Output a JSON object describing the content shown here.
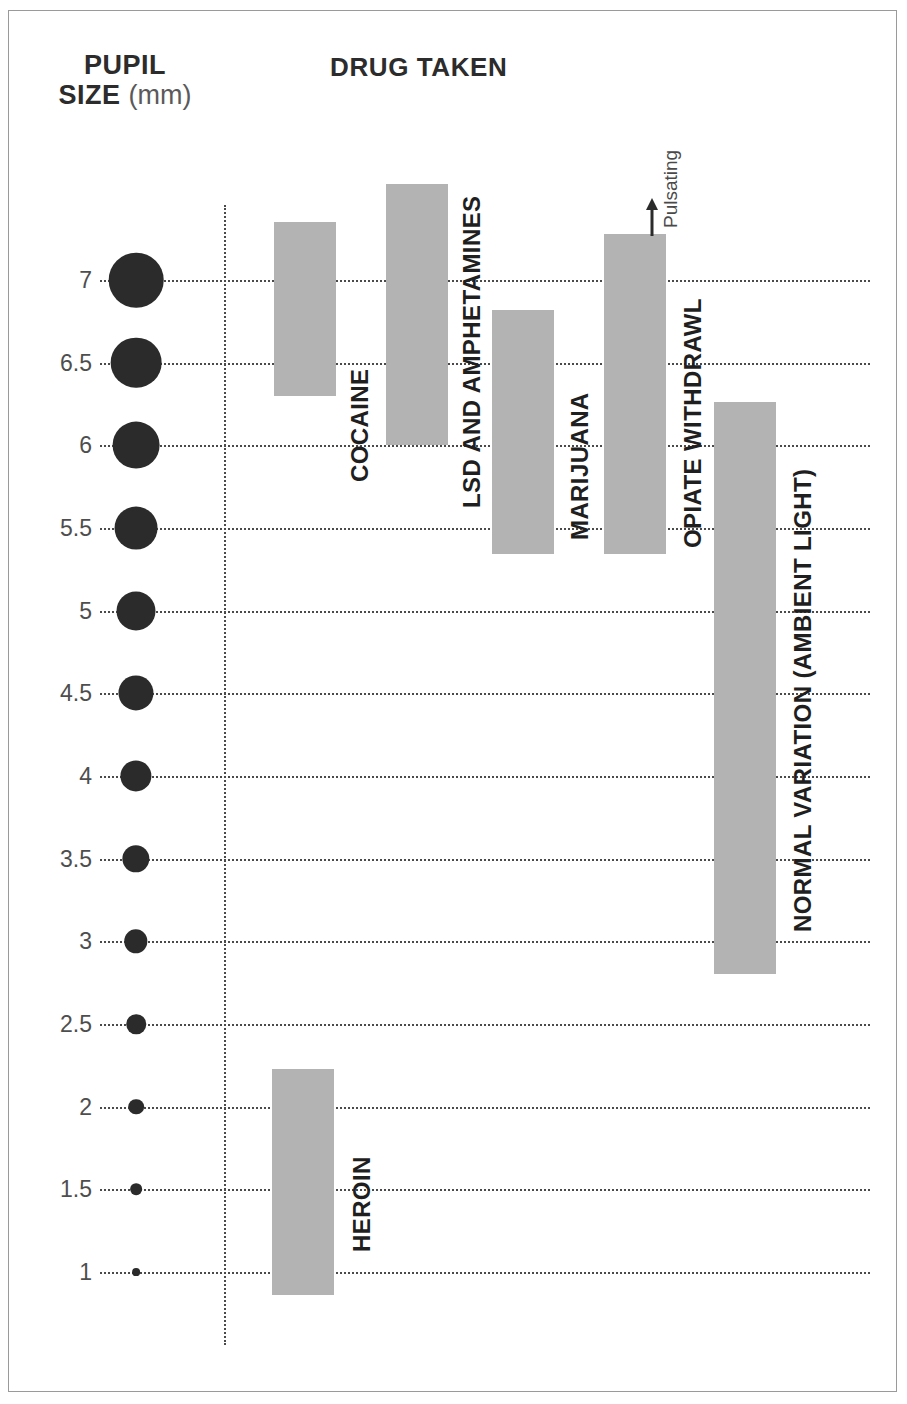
{
  "frame": {
    "border_color": "#9a9a9a"
  },
  "header": {
    "y_axis_title_line1": "PUPIL",
    "y_axis_title_line2": "SIZE",
    "y_axis_unit": "(mm)",
    "chart_title": "DRUG TAKEN"
  },
  "annotation": {
    "pulsating_label": "Pulsating",
    "arrow_icon": "up-arrow-icon"
  },
  "colors": {
    "bar_fill": "#b3b3b3",
    "grid": "#4a4a4a",
    "pupil": "#2b2b2b",
    "text": "#1f1f1f",
    "tick_text": "#4e4e4e"
  },
  "chart_data": {
    "type": "bar",
    "title": "DRUG TAKEN",
    "ylabel": "PUPIL SIZE (mm)",
    "xlabel": "",
    "ylim": [
      0.5,
      7.75
    ],
    "grid": true,
    "orientation": "vertical-range-bars",
    "tick_labels": [
      "7",
      "6.5",
      "6",
      "5.5",
      "5",
      "4.5",
      "4",
      "3.5",
      "3",
      "2.5",
      "2",
      "1.5",
      "1"
    ],
    "tick_values": [
      7,
      6.5,
      6,
      5.5,
      5,
      4.5,
      4,
      3.5,
      3,
      2.5,
      2,
      1.5,
      1
    ],
    "categories": [
      "COCAINE",
      "LSD AND AMPHETAMINES",
      "MARIJUANA",
      "OPIATE WITHDRAWL",
      "NORMAL VARIATION (AMBIENT LIGHT)",
      "HEROIN"
    ],
    "bars": [
      {
        "label": "COCAINE",
        "low": 6.3,
        "high": 7.35,
        "note": ""
      },
      {
        "label": "LSD AND AMPHETAMINES",
        "low": 6.0,
        "high": 7.58,
        "note": ""
      },
      {
        "label": "MARIJUANA",
        "low": 5.34,
        "high": 6.82,
        "note": ""
      },
      {
        "label": "OPIATE WITHDRAWL",
        "low": 5.34,
        "high": 7.28,
        "note": "Pulsating"
      },
      {
        "label": "NORMAL VARIATION (AMBIENT LIGHT)",
        "low": 2.8,
        "high": 6.26,
        "note": ""
      },
      {
        "label": "HEROIN",
        "low": 0.86,
        "high": 2.23,
        "note": ""
      }
    ],
    "pupil_sizes_mm": [
      7,
      6.5,
      6,
      5.5,
      5,
      4.5,
      4,
      3.5,
      3,
      2.5,
      2,
      1.5,
      1
    ]
  }
}
